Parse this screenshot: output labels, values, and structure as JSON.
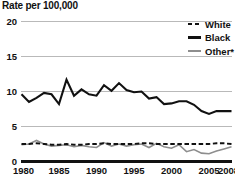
{
  "chart_data": {
    "type": "line",
    "title": "Rate per 100,000",
    "xlabel": "",
    "ylabel": "Rate per 100,000",
    "ylim": [
      0,
      20
    ],
    "xlim": [
      1980,
      2008
    ],
    "yticks": [
      "0",
      "5",
      "10",
      "15",
      "20"
    ],
    "ytick_values": [
      0,
      5,
      10,
      15,
      20
    ],
    "xticks": [
      "1980",
      "1985",
      "1990",
      "1995",
      "2000",
      "2005",
      "2008"
    ],
    "xtick_values": [
      1980,
      1985,
      1990,
      1995,
      2000,
      2005,
      2008
    ],
    "grid": "horizontal",
    "legend_position": "top-right",
    "x": [
      1980,
      1981,
      1982,
      1983,
      1984,
      1985,
      1986,
      1987,
      1988,
      1989,
      1990,
      1991,
      1992,
      1993,
      1994,
      1995,
      1996,
      1997,
      1998,
      1999,
      2000,
      2001,
      2002,
      2003,
      2004,
      2005,
      2006,
      2007,
      2008
    ],
    "series": [
      {
        "name": "White",
        "style": "dashed",
        "color": "#111111",
        "values": [
          2.5,
          2.5,
          2.6,
          2.5,
          2.4,
          2.4,
          2.5,
          2.4,
          2.4,
          2.5,
          2.5,
          2.6,
          2.5,
          2.5,
          2.5,
          2.5,
          2.6,
          2.6,
          2.5,
          2.5,
          2.5,
          2.5,
          2.5,
          2.5,
          2.5,
          2.5,
          2.6,
          2.6,
          2.5
        ]
      },
      {
        "name": "Black",
        "style": "solid",
        "color": "#111111",
        "values": [
          9.6,
          8.5,
          9.1,
          9.8,
          9.6,
          8.2,
          11.7,
          9.4,
          10.3,
          9.6,
          9.4,
          10.9,
          10.1,
          11.2,
          10.2,
          9.9,
          10.0,
          9.0,
          9.2,
          8.2,
          8.3,
          8.6,
          8.6,
          8.1,
          7.2,
          6.8,
          7.2,
          7.2,
          7.2
        ]
      },
      {
        "name": "Other*",
        "style": "solid",
        "color": "#8e8e8e",
        "values": [
          2.4,
          2.5,
          3.0,
          2.5,
          2.2,
          2.3,
          2.4,
          2.1,
          2.3,
          2.1,
          2.0,
          2.7,
          2.2,
          2.5,
          2.2,
          2.4,
          2.5,
          2.0,
          2.6,
          2.1,
          1.9,
          2.4,
          1.4,
          1.7,
          1.2,
          1.1,
          1.5,
          1.8,
          2.1
        ]
      }
    ],
    "footnote_marker": "*"
  },
  "legend": {
    "items": [
      {
        "label": "White",
        "style": "dashed",
        "color": "#111111"
      },
      {
        "label": "Black",
        "style": "solid",
        "color": "#111111"
      },
      {
        "label": "Other*",
        "style": "solid",
        "color": "#8e8e8e"
      }
    ]
  }
}
